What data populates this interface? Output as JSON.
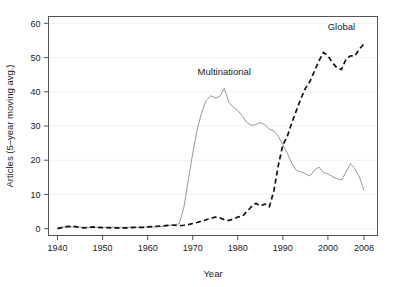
{
  "chart_data": {
    "type": "line",
    "title": "",
    "xlabel": "Year",
    "ylabel": "Articles (5–year moving avg.)",
    "xlim": [
      1938,
      2011
    ],
    "ylim": [
      -2,
      62
    ],
    "grid": "faint horizontal gridlines at y tick values",
    "legend_position": "inline labels above each series",
    "xticks": [
      1940,
      1950,
      1960,
      1970,
      1980,
      1990,
      2000,
      2008
    ],
    "xtick_labels": [
      "1940",
      "1950",
      "1960",
      "1970",
      "1980",
      "1990",
      "2000",
      "2008"
    ],
    "yticks": [
      0,
      10,
      20,
      30,
      40,
      50,
      60
    ],
    "ytick_labels": [
      "0",
      "10",
      "20",
      "30",
      "40",
      "50",
      "60"
    ],
    "series": [
      {
        "name": "Multinational",
        "style": "solid",
        "color": "#8c8c8c",
        "label_x": 1977,
        "label_y": 45,
        "x": [
          1940,
          1941,
          1942,
          1943,
          1944,
          1945,
          1946,
          1947,
          1948,
          1949,
          1950,
          1951,
          1952,
          1953,
          1954,
          1955,
          1956,
          1957,
          1958,
          1959,
          1960,
          1961,
          1962,
          1963,
          1964,
          1965,
          1966,
          1967,
          1968,
          1969,
          1970,
          1971,
          1972,
          1973,
          1974,
          1975,
          1976,
          1977,
          1978,
          1979,
          1980,
          1981,
          1982,
          1983,
          1984,
          1985,
          1986,
          1987,
          1988,
          1989,
          1990,
          1991,
          1992,
          1993,
          1994,
          1995,
          1996,
          1997,
          1998,
          1999,
          2000,
          2001,
          2002,
          2003,
          2004,
          2005,
          2006,
          2007,
          2008
        ],
        "y": [
          0.4,
          0.4,
          0.5,
          0.5,
          0.5,
          0.5,
          0.4,
          0.4,
          0.4,
          0.4,
          0.4,
          0.4,
          0.4,
          0.4,
          0.4,
          0.4,
          0.4,
          0.4,
          0.4,
          0.4,
          0.5,
          0.5,
          0.5,
          0.6,
          0.8,
          1.0,
          1.2,
          1.4,
          6.0,
          14.0,
          22.0,
          29.0,
          34.0,
          37.5,
          38.8,
          38.2,
          38.6,
          41.0,
          37.0,
          35.5,
          34.5,
          33.0,
          31.0,
          30.2,
          30.4,
          31.0,
          30.4,
          29.0,
          28.6,
          27.0,
          24.5,
          22.0,
          19.0,
          17.0,
          16.6,
          16.0,
          15.4,
          17.0,
          18.0,
          16.4,
          16.0,
          15.2,
          14.6,
          14.2,
          16.5,
          19.0,
          17.5,
          15.0,
          11.2
        ]
      },
      {
        "name": "Global",
        "style": "dashed",
        "color": "#111111",
        "label_x": 2003,
        "label_y": 58,
        "x": [
          1940,
          1941,
          1942,
          1943,
          1944,
          1945,
          1946,
          1947,
          1948,
          1949,
          1950,
          1951,
          1952,
          1953,
          1954,
          1955,
          1956,
          1957,
          1958,
          1959,
          1960,
          1961,
          1962,
          1963,
          1964,
          1965,
          1966,
          1967,
          1968,
          1969,
          1970,
          1971,
          1972,
          1973,
          1974,
          1975,
          1976,
          1977,
          1978,
          1979,
          1980,
          1981,
          1982,
          1983,
          1984,
          1985,
          1986,
          1987,
          1988,
          1989,
          1990,
          1991,
          1992,
          1993,
          1994,
          1995,
          1996,
          1997,
          1998,
          1999,
          2000,
          2001,
          2002,
          2003,
          2004,
          2005,
          2006,
          2007,
          2008
        ],
        "y": [
          0.0,
          0.3,
          0.6,
          0.7,
          0.6,
          0.3,
          0.2,
          0.4,
          0.5,
          0.4,
          0.3,
          0.3,
          0.2,
          0.2,
          0.1,
          0.2,
          0.3,
          0.4,
          0.4,
          0.4,
          0.5,
          0.6,
          0.7,
          0.8,
          0.9,
          1.0,
          1.0,
          0.9,
          1.0,
          1.2,
          1.5,
          1.8,
          2.2,
          2.6,
          3.0,
          3.4,
          3.2,
          2.6,
          2.4,
          2.8,
          3.4,
          3.6,
          5.0,
          6.4,
          7.4,
          6.6,
          7.2,
          6.4,
          11.0,
          18.5,
          24.5,
          27.0,
          31.0,
          34.5,
          38.0,
          41.0,
          43.0,
          46.0,
          49.0,
          51.5,
          50.5,
          48.5,
          47.0,
          46.5,
          49.5,
          50.5,
          50.5,
          52.5,
          54.0
        ]
      }
    ]
  },
  "labels": {
    "y_axis_title": "Articles (5–year moving avg.)",
    "x_axis_title": "Year",
    "series_multinational": "Multinational",
    "series_global": "Global"
  },
  "ticks": {
    "x": [
      "1940",
      "1950",
      "1960",
      "1970",
      "1980",
      "1990",
      "2000",
      "2008"
    ],
    "y": [
      "0",
      "10",
      "20",
      "30",
      "40",
      "50",
      "60"
    ]
  },
  "colors": {
    "multinational_line": "#8c8c8c",
    "global_line": "#111111",
    "frame": "#555555",
    "grid": "#f2f2f2",
    "background": "#ffffff"
  }
}
